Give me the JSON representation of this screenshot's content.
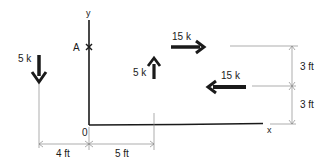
{
  "diagram": {
    "title": "",
    "axes": {
      "y_label": "y",
      "x_label": "x",
      "origin_label": "0",
      "point_label": "A"
    },
    "forces": [
      {
        "id": "f1",
        "label": "5 k",
        "direction": "down"
      },
      {
        "id": "f2",
        "label": "5 k",
        "direction": "up"
      },
      {
        "id": "f3",
        "label": "15 k",
        "direction": "right"
      },
      {
        "id": "f4",
        "label": "15 k",
        "direction": "left"
      }
    ],
    "dimensions": {
      "horizontal": [
        {
          "label": "4 ft"
        },
        {
          "label": "5 ft"
        }
      ],
      "vertical": [
        {
          "label": "3 ft"
        },
        {
          "label": "3 ft"
        }
      ]
    },
    "colors": {
      "ink": "#1a1a1a",
      "thin_line": "#8a8a8a",
      "background": "#ffffff"
    }
  }
}
